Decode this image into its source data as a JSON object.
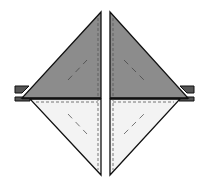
{
  "diagram": {
    "colors": {
      "dark_fabric": "#8c8c8c",
      "light_fabric": "#f3f3f3",
      "outline": "#111111",
      "seam": "#555555",
      "background": "#ffffff"
    },
    "pieces": [
      {
        "name": "left-top-triangle",
        "fabric": "dark"
      },
      {
        "name": "left-bottom-triangle",
        "fabric": "light"
      },
      {
        "name": "right-top-triangle",
        "fabric": "dark"
      },
      {
        "name": "right-bottom-triangle",
        "fabric": "light"
      }
    ]
  }
}
